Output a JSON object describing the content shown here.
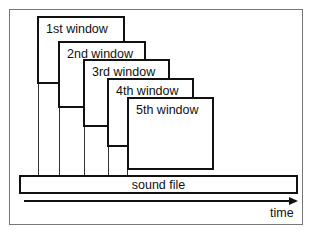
{
  "diagram": {
    "windows": [
      {
        "label": "1st window"
      },
      {
        "label": "2nd window"
      },
      {
        "label": "3rd window"
      },
      {
        "label": "4th window"
      },
      {
        "label": "5th window"
      }
    ],
    "sound_file_label": "sound file",
    "axis_label": "time"
  }
}
